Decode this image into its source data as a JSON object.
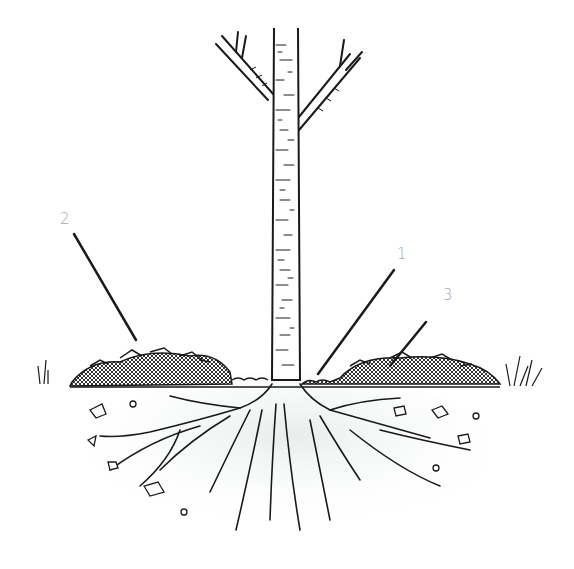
{
  "diagram": {
    "colors": {
      "ink": "#1a1a1a",
      "label": "#a8a8a8",
      "soil_shade": "#e8eeec",
      "background": "#ffffff"
    },
    "callouts": [
      {
        "id": "1",
        "label": "1",
        "points_to": "mulch-gap-at-trunk-base"
      },
      {
        "id": "2",
        "label": "2",
        "points_to": "mulch-layer-left"
      },
      {
        "id": "3",
        "label": "3",
        "points_to": "mulch-layer-right"
      }
    ]
  }
}
